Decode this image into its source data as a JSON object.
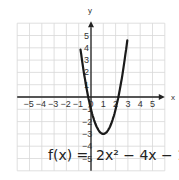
{
  "chart_data": {
    "type": "line",
    "title": "",
    "xlabel": "x",
    "ylabel": "y",
    "xlim": [
      -6,
      6
    ],
    "ylim": [
      -6,
      6
    ],
    "grid": true,
    "x_ticks": [
      "-5",
      "-4",
      "-3",
      "-2",
      "-1",
      "0",
      "1",
      "2",
      "3",
      "4",
      "5"
    ],
    "y_ticks": [
      "5",
      "4",
      "3",
      "2",
      "1",
      "-1",
      "-2",
      "-3",
      "-4",
      "-5"
    ],
    "series": [
      {
        "name": "f(x) = 2x^2 - 4x - 1",
        "function": "2x^2-4x-1",
        "x": [
          -0.8,
          -0.5,
          0,
          0.5,
          1,
          1.5,
          2,
          2.5,
          2.8
        ],
        "y": [
          3.5,
          2.5,
          -1,
          -2.5,
          -3,
          -2.5,
          -1,
          1.5,
          3.5
        ]
      }
    ],
    "annotations": [
      {
        "text": "f(x) = 2x² − 4x − 1",
        "position": "bottom-right"
      }
    ],
    "vertex": [
      1,
      -3
    ]
  },
  "labels": {
    "x_axis": "x",
    "y_axis": "y",
    "equation_lhs": "f(x) =",
    "equation_rhs": "2x² − 4x − 1"
  }
}
